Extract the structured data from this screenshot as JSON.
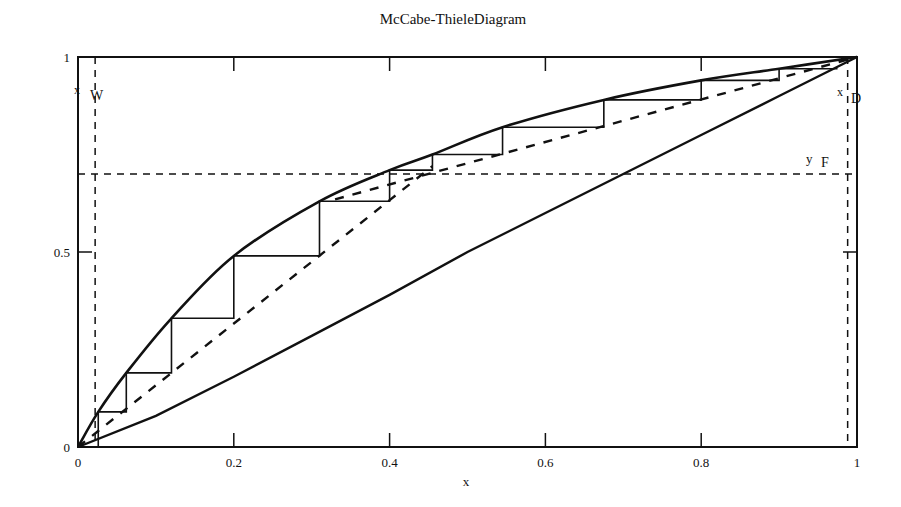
{
  "chart_data": {
    "type": "line",
    "title": "McCabe-ThieleDiagram",
    "xlabel": "x",
    "ylabel": "",
    "xlim": [
      0,
      1
    ],
    "ylim": [
      0,
      1
    ],
    "grid": false,
    "legend": null,
    "x_ticks": [
      "0",
      "0.2",
      "0.4",
      "0.6",
      "0.8",
      "1"
    ],
    "x_tick_values": [
      0,
      0.2,
      0.4,
      0.6,
      0.8,
      1
    ],
    "y_ticks": [
      "0",
      "0.5",
      "1"
    ],
    "y_tick_values": [
      0,
      0.5,
      1
    ],
    "annotations": [
      {
        "text": "x",
        "sub": "W",
        "x": 0.0,
        "y": 0.9
      },
      {
        "text": "x",
        "sub": "D",
        "x": 0.985,
        "y": 0.9
      },
      {
        "text": "y",
        "sub": "F",
        "x": 0.97,
        "y": 0.735
      }
    ],
    "reference_lines": {
      "x_W": 0.022,
      "x_D": 0.988,
      "y_F": 0.7
    },
    "series": [
      {
        "name": "equilibrium curve",
        "style": "solid-thick",
        "x": [
          0,
          0.026,
          0.062,
          0.12,
          0.2,
          0.31,
          0.4,
          0.455,
          0.545,
          0.675,
          0.8,
          0.9,
          1.0
        ],
        "y": [
          0,
          0.09,
          0.19,
          0.33,
          0.49,
          0.63,
          0.71,
          0.75,
          0.82,
          0.89,
          0.94,
          0.97,
          1.0
        ]
      },
      {
        "name": "diagonal y=x",
        "style": "solid",
        "x": [
          0,
          0.1,
          0.2,
          0.3,
          0.4,
          0.5,
          0.6,
          0.7,
          0.8,
          0.9,
          1.0
        ],
        "y": [
          0,
          0.08,
          0.18,
          0.285,
          0.39,
          0.5,
          0.6,
          0.7,
          0.8,
          0.9,
          1.0
        ]
      },
      {
        "name": "stripping operating line",
        "style": "dashed",
        "x": [
          0.0,
          0.455
        ],
        "y": [
          0.0,
          0.72
        ]
      },
      {
        "name": "rectifying operating line",
        "style": "dashed",
        "x": [
          0.33,
          1.0
        ],
        "y": [
          0.635,
          1.0
        ]
      },
      {
        "name": "stages (staircase)",
        "style": "solid-thin",
        "x": [
          0.0,
          0.026,
          0.026,
          0.062,
          0.062,
          0.12,
          0.12,
          0.2,
          0.2,
          0.31,
          0.31,
          0.4,
          0.4,
          0.455,
          0.455,
          0.545,
          0.545,
          0.675,
          0.675,
          0.8,
          0.8,
          0.9,
          0.9,
          0.975
        ],
        "y": [
          0.0,
          0.0,
          0.09,
          0.09,
          0.19,
          0.19,
          0.33,
          0.33,
          0.49,
          0.49,
          0.63,
          0.63,
          0.71,
          0.71,
          0.75,
          0.75,
          0.82,
          0.82,
          0.89,
          0.89,
          0.94,
          0.94,
          0.97,
          0.97
        ]
      }
    ]
  },
  "title": "McCabe-ThieleDiagram",
  "xlabel": "x",
  "labels": {
    "xw_main": "x",
    "xw_sub": "W",
    "xd_main": "x",
    "xd_sub": "D",
    "yf_main": "y",
    "yf_sub": "F"
  },
  "colors": {
    "line": "#111111",
    "background": "#ffffff"
  }
}
